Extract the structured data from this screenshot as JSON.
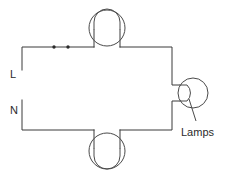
{
  "diagram": {
    "type": "electrical-circuit-schematic",
    "title": "",
    "background_color": "#ffffff",
    "line_color": "#3a3a3a",
    "terminals": [
      {
        "id": "line",
        "label": "L",
        "x": 10,
        "y": 74
      },
      {
        "id": "neutral",
        "label": "N",
        "x": 10,
        "y": 110
      }
    ],
    "annotations": [
      {
        "id": "lamps-callout",
        "label": "Lamps",
        "x": 182,
        "y": 133
      }
    ],
    "lamps": [
      {
        "id": "lamp-top",
        "cx": 107,
        "cy": 28,
        "r": 18,
        "orientation": "down"
      },
      {
        "id": "lamp-right",
        "cx": 193,
        "cy": 93,
        "r": 15,
        "orientation": "left"
      },
      {
        "id": "lamp-bottom",
        "cx": 107,
        "cy": 152,
        "r": 18,
        "orientation": "up"
      }
    ],
    "junctions": [
      {
        "id": "junction-1",
        "cx": 54,
        "cy": 47,
        "r": 1.6
      },
      {
        "id": "junction-2",
        "cx": 68,
        "cy": 47,
        "r": 1.6
      }
    ],
    "wire_paths": {
      "line_branch": "M 22,70 L 22,47 L 94,47 M 120,47 L 172,47 L 172,85 L 178,85",
      "neutral_branch": "M 22,100 L 22,130 L 94,130 M 120,130 L 172,130 L 172,100 L 178,100",
      "lamp_top_leads": "M 94,47 L 94,37 M 120,47 L 120,37",
      "lamp_bottom_leads": "M 94,130 L 94,141 M 120,130 L 120,141"
    }
  }
}
